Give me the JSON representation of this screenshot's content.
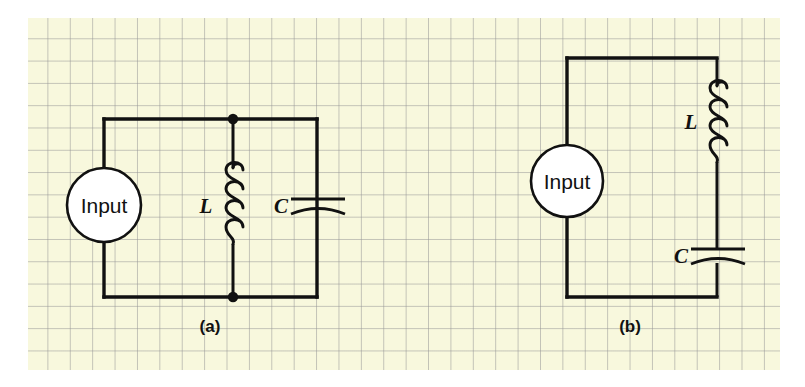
{
  "figure": {
    "background_color": "#ffffff",
    "paper_color": "#f8f8dd",
    "grid_color": "#969696",
    "wire_color": "#111111"
  },
  "circuits": [
    {
      "id": "a",
      "caption": "(a)",
      "topology": "parallel-LC-tank",
      "source_label": "Input",
      "inductor_label": "L",
      "capacitor_label": "C"
    },
    {
      "id": "b",
      "caption": "(b)",
      "topology": "series-LC",
      "source_label": "Input",
      "inductor_label": "L",
      "capacitor_label": "C"
    }
  ]
}
